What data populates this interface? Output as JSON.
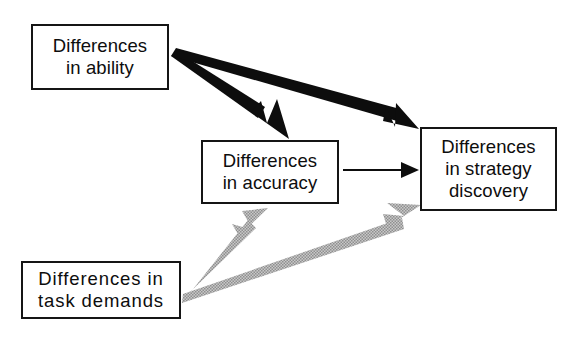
{
  "diagram": {
    "type": "path-model",
    "title": "",
    "background_color": "#ffffff",
    "nodes": [
      {
        "id": "ability",
        "label": "Differences in ability",
        "lines": [
          "Differences",
          "in ability"
        ],
        "border_color": "#151515",
        "fill_color": "#ffffff"
      },
      {
        "id": "accuracy",
        "label": "Differences in accuracy",
        "lines": [
          "Differences",
          "in accuracy"
        ],
        "border_color": "#151515",
        "fill_color": "#ffffff"
      },
      {
        "id": "strategy",
        "label": "Differences in strategy discovery",
        "lines": [
          "Differences",
          "in strategy",
          "discovery"
        ],
        "border_color": "#151515",
        "fill_color": "#ffffff"
      },
      {
        "id": "demands",
        "label": "Differences in task demands",
        "lines": [
          "Differences in",
          "task demands"
        ],
        "border_color": "#151515",
        "fill_color": "#ffffff"
      }
    ],
    "edges": [
      {
        "id": "ability-to-accuracy",
        "from": "ability",
        "to": "accuracy",
        "style": "thick-black",
        "color": "#0d0d0d"
      },
      {
        "id": "ability-to-strategy",
        "from": "ability",
        "to": "strategy",
        "style": "thick-black",
        "color": "#0d0d0d"
      },
      {
        "id": "accuracy-to-strategy",
        "from": "accuracy",
        "to": "strategy",
        "style": "thin-black",
        "color": "#0d0d0d"
      },
      {
        "id": "demands-to-accuracy",
        "from": "demands",
        "to": "accuracy",
        "style": "thick-gray-halftone",
        "color": "#a8a8a8"
      },
      {
        "id": "demands-to-strategy",
        "from": "demands",
        "to": "strategy",
        "style": "thick-gray-halftone",
        "color": "#a8a8a8"
      }
    ]
  }
}
